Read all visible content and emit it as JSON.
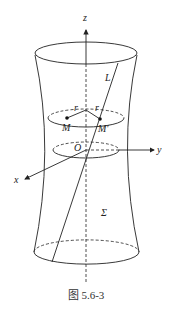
{
  "figure": {
    "caption": "图 5.6-3",
    "labels": {
      "z_axis": "z",
      "y_axis": "y",
      "x_axis": "x",
      "origin": "O",
      "line": "L",
      "point_m": "M",
      "point_m_prime": "M'",
      "radius_left": "r",
      "radius_right": "r",
      "surface": "Σ"
    }
  }
}
